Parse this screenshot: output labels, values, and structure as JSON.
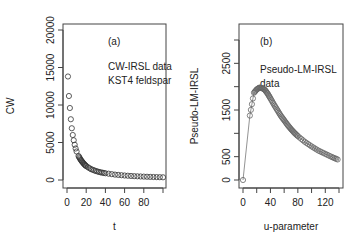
{
  "chart_data": [
    {
      "type": "scatter",
      "panel_label": "(a)",
      "annotation": [
        "CW-IRSL data",
        "KST4 feldspar"
      ],
      "xlabel": "t",
      "ylabel": "CW",
      "xlim": [
        0,
        100
      ],
      "ylim": [
        0,
        20000
      ],
      "x_ticks": [
        0,
        20,
        40,
        60,
        80,
        100
      ],
      "x_tick_labels": [
        "0",
        "20",
        "40",
        "60",
        "80",
        ""
      ],
      "y_ticks": [
        0,
        5000,
        10000,
        15000,
        20000
      ],
      "y_tick_labels": [
        "0",
        "5000",
        "10000",
        "15000",
        "20000"
      ],
      "grid": false,
      "marker": "open-circle",
      "series": [
        {
          "name": "CW-IRSL data",
          "x": [
            1,
            2,
            3,
            4,
            5,
            6,
            7,
            8,
            9,
            10,
            12,
            14,
            16,
            18,
            20,
            25,
            30,
            35,
            40,
            50,
            60,
            70,
            80,
            90,
            100
          ],
          "values": [
            13800,
            11200,
            9600,
            8100,
            6900,
            6000,
            5300,
            4700,
            4200,
            3800,
            3200,
            2750,
            2400,
            2100,
            1850,
            1450,
            1200,
            1020,
            900,
            720,
            600,
            510,
            450,
            400,
            360
          ]
        }
      ]
    },
    {
      "type": "line",
      "panel_label": "(b)",
      "annotation": [
        "Pseudo-LM-IRSL",
        "data"
      ],
      "xlabel": "u-parameter",
      "ylabel": "Pseudo-LM-IRSL",
      "xlim": [
        0,
        140
      ],
      "ylim": [
        0,
        3000
      ],
      "x_ticks": [
        0,
        20,
        40,
        60,
        80,
        100,
        120,
        140
      ],
      "x_tick_labels": [
        "0",
        "",
        "40",
        "",
        "80",
        "",
        "120",
        ""
      ],
      "y_ticks": [
        0,
        500,
        1000,
        1500,
        2000,
        2500,
        3000
      ],
      "y_tick_labels": [
        "0",
        "500",
        "",
        "1500",
        "",
        "2500",
        ""
      ],
      "grid": false,
      "marker": "open-circle-with-line",
      "series": [
        {
          "name": "Pseudo-LM-IRSL data",
          "x": [
            0,
            10,
            16,
            20,
            24,
            28,
            32,
            36,
            40,
            45,
            50,
            55,
            60,
            65,
            70,
            75,
            80,
            90,
            100,
            110,
            120,
            130,
            138
          ],
          "values": [
            0,
            1380,
            1870,
            1940,
            1980,
            1970,
            1930,
            1850,
            1750,
            1620,
            1500,
            1380,
            1280,
            1180,
            1090,
            1010,
            940,
            820,
            720,
            630,
            560,
            490,
            440
          ]
        }
      ]
    }
  ]
}
